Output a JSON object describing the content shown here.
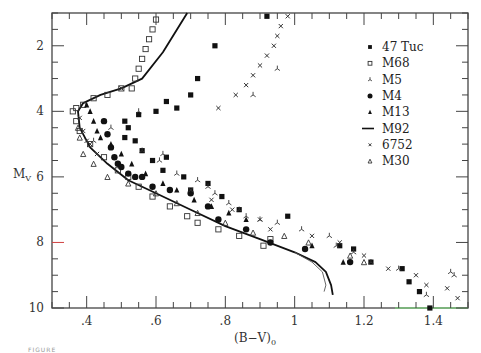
{
  "figure": {
    "caption_fragment": "FIGURE"
  },
  "chart_data": {
    "type": "scatter",
    "title": "",
    "xlabel": "(B-V)0",
    "ylabel": "My",
    "xlim": [
      0.3,
      1.5
    ],
    "ylim": [
      10,
      1
    ],
    "y_inverted": true,
    "x_ticks": [
      ".4",
      ".6",
      ".8",
      "1",
      "1.2",
      "1.4"
    ],
    "y_ticks": [
      "2",
      "4",
      "6",
      "8",
      "10"
    ],
    "grid": false,
    "legend_position": "upper right",
    "legend": [
      {
        "name": "47 Tuc",
        "marker": "filled-square"
      },
      {
        "name": "M68",
        "marker": "open-square"
      },
      {
        "name": "M5",
        "marker": "tripod"
      },
      {
        "name": "M4",
        "marker": "filled-circle"
      },
      {
        "name": "M13",
        "marker": "filled-triangle"
      },
      {
        "name": "M92",
        "marker": "line"
      },
      {
        "name": "6752",
        "marker": "cross"
      },
      {
        "name": "M30",
        "marker": "open-triangle"
      }
    ],
    "series": [
      {
        "name": "47 Tuc",
        "marker": "filled-square",
        "points": [
          [
            0.92,
            1.1
          ],
          [
            0.77,
            2.0
          ],
          [
            0.72,
            3.0
          ],
          [
            0.7,
            3.5
          ],
          [
            0.66,
            3.9
          ],
          [
            0.63,
            3.7
          ],
          [
            0.6,
            4.0
          ],
          [
            0.55,
            4.1
          ],
          [
            0.52,
            4.5
          ],
          [
            0.51,
            4.3
          ],
          [
            0.51,
            4.8
          ],
          [
            0.54,
            4.9
          ],
          [
            0.56,
            5.2
          ],
          [
            0.59,
            5.5
          ],
          [
            0.62,
            5.8
          ],
          [
            0.63,
            5.4
          ],
          [
            0.68,
            6.0
          ],
          [
            0.7,
            6.4
          ],
          [
            0.75,
            6.2
          ],
          [
            0.79,
            6.6
          ],
          [
            0.84,
            7.0
          ],
          [
            0.98,
            7.2
          ],
          [
            1.13,
            8.1
          ],
          [
            1.17,
            8.2
          ],
          [
            1.22,
            8.6
          ],
          [
            1.31,
            8.8
          ],
          [
            1.33,
            9.2
          ],
          [
            1.36,
            9.5
          ],
          [
            1.39,
            10.0
          ]
        ]
      },
      {
        "name": "M68",
        "marker": "open-square",
        "points": [
          [
            0.6,
            1.2
          ],
          [
            0.59,
            1.5
          ],
          [
            0.58,
            1.8
          ],
          [
            0.57,
            2.1
          ],
          [
            0.56,
            2.4
          ],
          [
            0.55,
            2.7
          ],
          [
            0.54,
            3.0
          ],
          [
            0.53,
            3.3
          ],
          [
            0.5,
            3.3
          ],
          [
            0.46,
            3.5
          ],
          [
            0.42,
            3.6
          ],
          [
            0.39,
            3.8
          ],
          [
            0.37,
            3.9
          ],
          [
            0.36,
            4.0
          ],
          [
            0.37,
            4.3
          ],
          [
            0.38,
            4.6
          ],
          [
            0.41,
            5.0
          ],
          [
            0.45,
            5.4
          ],
          [
            0.49,
            5.8
          ],
          [
            0.52,
            6.0
          ],
          [
            0.55,
            6.3
          ],
          [
            0.59,
            6.6
          ],
          [
            0.64,
            6.9
          ],
          [
            0.69,
            7.2
          ],
          [
            0.72,
            7.4
          ],
          [
            0.78,
            7.6
          ],
          [
            0.84,
            7.8
          ],
          [
            0.91,
            8.1
          ],
          [
            0.93,
            7.9
          ]
        ]
      },
      {
        "name": "M5",
        "marker": "tripod",
        "points": [
          [
            0.95,
            2.7
          ],
          [
            0.88,
            3.5
          ],
          [
            0.55,
            4.0
          ],
          [
            0.47,
            4.5
          ],
          [
            0.42,
            4.9
          ],
          [
            0.56,
            5.2
          ],
          [
            0.62,
            5.3
          ],
          [
            0.61,
            5.5
          ],
          [
            0.66,
            5.9
          ],
          [
            0.72,
            6.1
          ],
          [
            0.75,
            6.3
          ],
          [
            0.77,
            6.5
          ],
          [
            0.81,
            6.8
          ],
          [
            0.84,
            7.0
          ],
          [
            0.86,
            7.2
          ],
          [
            0.9,
            7.3
          ],
          [
            0.95,
            7.4
          ],
          [
            1.02,
            7.6
          ],
          [
            1.1,
            7.8
          ],
          [
            1.12,
            8.1
          ],
          [
            1.17,
            8.3
          ],
          [
            1.22,
            8.6
          ],
          [
            1.3,
            8.8
          ],
          [
            1.38,
            9.6
          ],
          [
            1.46,
            9.0
          ],
          [
            1.45,
            8.9
          ]
        ]
      },
      {
        "name": "M4",
        "marker": "filled-circle",
        "points": [
          [
            0.45,
            4.3
          ],
          [
            0.46,
            4.7
          ],
          [
            0.47,
            5.1
          ],
          [
            0.48,
            5.4
          ],
          [
            0.49,
            5.6
          ],
          [
            0.5,
            5.7
          ],
          [
            0.52,
            5.9
          ],
          [
            0.54,
            6.0
          ],
          [
            0.56,
            6.0
          ],
          [
            0.59,
            6.3
          ],
          [
            0.64,
            6.4
          ],
          [
            0.7,
            6.5
          ],
          [
            0.75,
            6.9
          ],
          [
            0.78,
            7.3
          ],
          [
            0.86,
            7.6
          ],
          [
            0.93,
            8.0
          ],
          [
            1.03,
            8.2
          ],
          [
            1.16,
            8.6
          ]
        ]
      },
      {
        "name": "M13",
        "marker": "filled-triangle",
        "points": [
          [
            0.4,
            3.8
          ],
          [
            0.41,
            4.0
          ],
          [
            0.42,
            4.3
          ],
          [
            0.43,
            4.6
          ],
          [
            0.44,
            4.8
          ],
          [
            0.47,
            5.0
          ],
          [
            0.5,
            5.3
          ],
          [
            0.53,
            5.6
          ],
          [
            0.57,
            5.9
          ],
          [
            0.62,
            6.2
          ],
          [
            0.66,
            6.4
          ],
          [
            0.71,
            6.7
          ],
          [
            0.76,
            6.9
          ],
          [
            0.81,
            7.1
          ],
          [
            0.86,
            7.3
          ],
          [
            1.05,
            8.1
          ],
          [
            1.14,
            8.6
          ]
        ]
      },
      {
        "name": "M92",
        "marker": "line",
        "points": [
          [
            0.69,
            1.0
          ],
          [
            0.62,
            2.2
          ],
          [
            0.56,
            3.0
          ],
          [
            0.5,
            3.3
          ],
          [
            0.44,
            3.5
          ],
          [
            0.39,
            3.75
          ],
          [
            0.375,
            4.0
          ],
          [
            0.38,
            4.5
          ],
          [
            0.41,
            5.1
          ],
          [
            0.46,
            5.6
          ],
          [
            0.52,
            6.1
          ],
          [
            0.6,
            6.5
          ],
          [
            0.7,
            7.0
          ],
          [
            0.8,
            7.5
          ],
          [
            0.9,
            7.9
          ],
          [
            1.0,
            8.3
          ],
          [
            1.06,
            8.6
          ],
          [
            1.09,
            8.9
          ],
          [
            1.105,
            9.3
          ],
          [
            1.11,
            9.6
          ]
        ]
      },
      {
        "name": "6752",
        "marker": "cross",
        "points": [
          [
            0.98,
            1.1
          ],
          [
            0.96,
            1.4
          ],
          [
            0.95,
            1.7
          ],
          [
            0.94,
            2.0
          ],
          [
            0.92,
            2.3
          ],
          [
            0.9,
            2.6
          ],
          [
            0.88,
            2.9
          ],
          [
            0.86,
            3.2
          ],
          [
            0.83,
            3.5
          ],
          [
            0.78,
            3.9
          ],
          [
            0.5,
            3.3
          ],
          [
            0.38,
            4.2
          ],
          [
            0.39,
            4.6
          ],
          [
            0.4,
            4.9
          ],
          [
            0.41,
            5.0
          ],
          [
            0.43,
            5.3
          ],
          [
            0.7,
            6.4
          ],
          [
            0.76,
            6.7
          ],
          [
            0.82,
            7.0
          ],
          [
            0.9,
            7.3
          ],
          [
            0.93,
            7.6
          ],
          [
            1.05,
            7.8
          ],
          [
            1.13,
            8.0
          ],
          [
            1.2,
            8.4
          ],
          [
            1.27,
            8.8
          ],
          [
            1.35,
            9.0
          ],
          [
            1.38,
            9.3
          ],
          [
            1.44,
            9.4
          ],
          [
            1.47,
            9.7
          ]
        ]
      },
      {
        "name": "M30",
        "marker": "open-triangle",
        "points": [
          [
            0.375,
            4.5
          ],
          [
            0.38,
            4.8
          ],
          [
            0.39,
            5.3
          ],
          [
            0.42,
            5.6
          ],
          [
            0.46,
            6.0
          ],
          [
            0.52,
            6.2
          ],
          [
            0.6,
            6.5
          ],
          [
            0.66,
            6.8
          ],
          [
            0.72,
            7.1
          ],
          [
            0.8,
            7.4
          ],
          [
            0.88,
            7.7
          ],
          [
            0.97,
            7.8
          ],
          [
            1.04,
            8.0
          ],
          [
            1.16,
            8.4
          ],
          [
            1.2,
            8.6
          ]
        ]
      }
    ],
    "annotations": [
      {
        "name": "M92 second isochrone (thin)",
        "points": [
          [
            1.0,
            8.3
          ],
          [
            1.05,
            8.6
          ],
          [
            1.08,
            8.9
          ],
          [
            1.09,
            9.3
          ],
          [
            1.085,
            9.5
          ]
        ]
      }
    ]
  }
}
